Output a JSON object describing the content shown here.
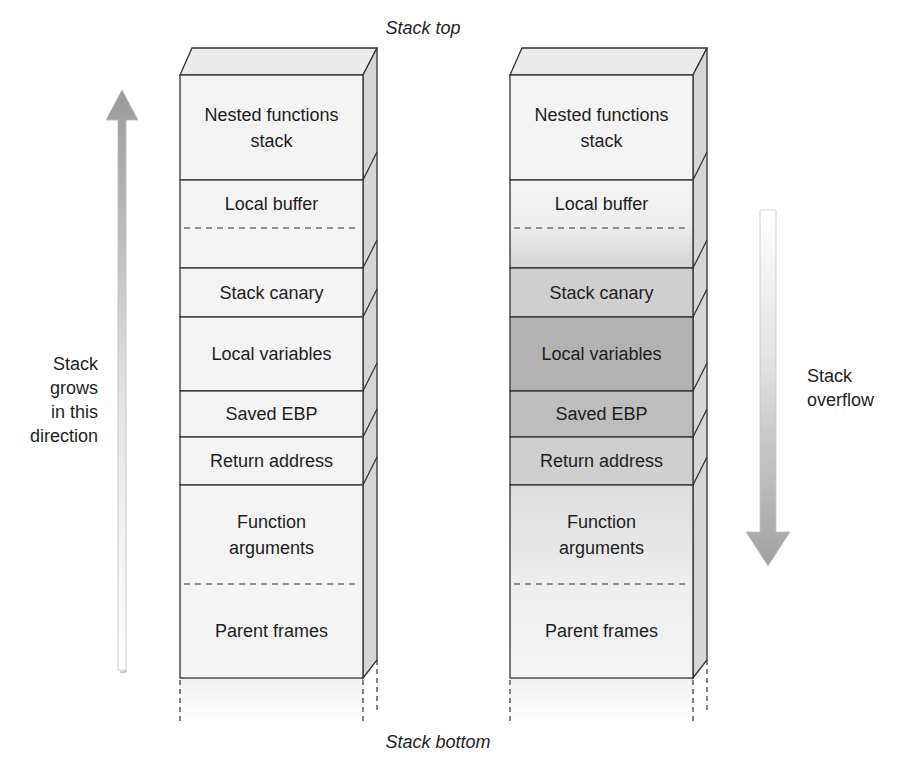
{
  "title_top": "Stack top",
  "title_bottom": "Stack bottom",
  "left_arrow": {
    "label_lines": [
      "Stack",
      "grows",
      "in this",
      "direction"
    ],
    "direction": "up"
  },
  "right_arrow": {
    "label_lines": [
      "Stack",
      "overflow"
    ],
    "direction": "down"
  },
  "stacks": [
    {
      "id": "normal",
      "rows": [
        {
          "label_lines": [
            "Nested functions",
            "stack"
          ],
          "shade": "light"
        },
        {
          "label_lines": [
            "Local buffer"
          ],
          "shade": "light",
          "dashed_split": true
        },
        {
          "label_lines": [
            "Stack canary"
          ],
          "shade": "light"
        },
        {
          "label_lines": [
            "Local variables"
          ],
          "shade": "light"
        },
        {
          "label_lines": [
            "Saved EBP"
          ],
          "shade": "light"
        },
        {
          "label_lines": [
            "Return address"
          ],
          "shade": "light"
        },
        {
          "label_lines": [
            "Function",
            "arguments"
          ],
          "shade": "light",
          "dashed_split": true,
          "below_label_lines": [
            "Parent frames"
          ]
        }
      ]
    },
    {
      "id": "overflowed",
      "rows": [
        {
          "label_lines": [
            "Nested functions",
            "stack"
          ],
          "shade": "light"
        },
        {
          "label_lines": [
            "Local buffer"
          ],
          "shade": "gradient",
          "dashed_split": true
        },
        {
          "label_lines": [
            "Stack canary"
          ],
          "shade": "mid"
        },
        {
          "label_lines": [
            "Local variables"
          ],
          "shade": "dark"
        },
        {
          "label_lines": [
            "Saved EBP"
          ],
          "shade": "mid-dark"
        },
        {
          "label_lines": [
            "Return address"
          ],
          "shade": "mid"
        },
        {
          "label_lines": [
            "Function",
            "arguments"
          ],
          "shade": "gradient-light",
          "dashed_split": true,
          "below_label_lines": [
            "Parent frames"
          ]
        }
      ]
    }
  ],
  "colors": {
    "face_light": "#f4f4f4",
    "side_face": "#d6d6d6",
    "top_face": "#ebebeb",
    "shade_mid": "#cfcfcf",
    "shade_mid_dark": "#bdbdbd",
    "shade_dark": "#b2b2b2",
    "arrow": "#a8a8a8",
    "stroke": "#333333"
  }
}
